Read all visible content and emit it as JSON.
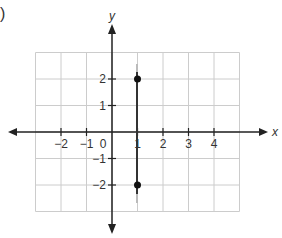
{
  "figure": {
    "part_marker": ")"
  },
  "chart_data": {
    "type": "scatter",
    "title": "",
    "xlabel": "x",
    "ylabel": "y",
    "xlim": [
      -3,
      5
    ],
    "ylim": [
      -3,
      3
    ],
    "grid": true,
    "x_ticks": [
      -2,
      -1,
      0,
      1,
      2,
      3,
      4
    ],
    "x_tick_labels": [
      "−2",
      "−1",
      "0",
      "1",
      "2",
      "3",
      "4"
    ],
    "y_ticks": [
      2,
      1,
      -1,
      -2
    ],
    "y_tick_labels": [
      "2",
      "1",
      "−1",
      "−2"
    ],
    "series": [
      {
        "name": "points",
        "points": [
          {
            "x": 1,
            "y": 2
          },
          {
            "x": 1,
            "y": -2
          }
        ]
      },
      {
        "name": "vertical line x = 1",
        "type": "line",
        "points": [
          {
            "x": 1,
            "y": 2.6
          },
          {
            "x": 1,
            "y": -2.6
          }
        ]
      }
    ],
    "colors": {
      "axis": "#222222",
      "grid": "#cccccc",
      "point": "#111111",
      "line": "#333333"
    }
  }
}
